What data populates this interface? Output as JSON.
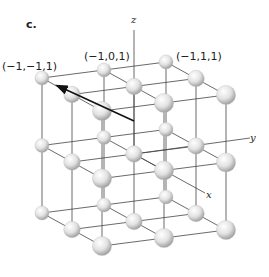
{
  "panel_label": "c.",
  "coord_labels": {
    "a": "(−1,−1,1)",
    "b": "(−1,0,1)",
    "c": "(−1,1,1)"
  },
  "axes": {
    "z": "z",
    "y": "y",
    "x": "x"
  },
  "lattice": {
    "type": "simple cubic 3×3×3",
    "colors": {
      "line": "#333333",
      "sphere_light": "#ffffff",
      "sphere_dark": "#a8a8a8",
      "arrow": "#111111"
    }
  }
}
